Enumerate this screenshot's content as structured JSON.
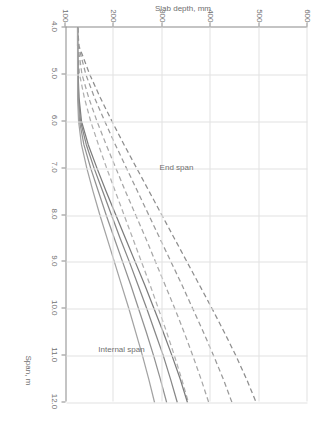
{
  "chart_data": {
    "type": "line",
    "title": "",
    "xlabel": "Span, m",
    "ylabel": "Slab depth, mm",
    "xlim": [
      4.0,
      12.0
    ],
    "ylim": [
      100,
      600
    ],
    "xticks": [
      "4.0",
      "5.0",
      "6.0",
      "7.0",
      "8.0",
      "9.0",
      "10.0",
      "11.0",
      "12.0"
    ],
    "yticks": [
      "100",
      "200",
      "300",
      "400",
      "500",
      "600"
    ],
    "grid": true,
    "legend_position": "none",
    "annotations": [
      {
        "text": "End span",
        "x": 7.0,
        "y": 330
      },
      {
        "text": "Internal span",
        "x": 10.9,
        "y": 215
      }
    ],
    "series": [
      {
        "name": "End span 1",
        "style": "dashed",
        "color": "#8e8e8e",
        "group": "End span",
        "x": [
          4.0,
          4.4,
          5.0,
          5.5,
          6.0,
          6.5,
          7.0,
          7.5,
          8.0,
          8.5,
          9.0,
          9.5,
          10.0,
          10.5,
          11.0,
          11.5,
          12.0
        ],
        "y": [
          125,
          128,
          150,
          172,
          196,
          221,
          247,
          273,
          299,
          325,
          351,
          377,
          403,
          428,
          452,
          474,
          494
        ]
      },
      {
        "name": "End span 2",
        "style": "dashed",
        "color": "#9a9a9a",
        "group": "End span",
        "x": [
          4.0,
          4.4,
          5.0,
          5.5,
          6.0,
          6.5,
          7.0,
          7.5,
          8.0,
          8.5,
          9.0,
          9.5,
          10.0,
          10.5,
          11.0,
          11.5,
          12.0
        ],
        "y": [
          125,
          127,
          142,
          160,
          181,
          203,
          226,
          249,
          272,
          295,
          318,
          341,
          363,
          385,
          406,
          426,
          444
        ]
      },
      {
        "name": "End span 3",
        "style": "dashed",
        "color": "#a6a6a6",
        "group": "End span",
        "x": [
          4.0,
          4.4,
          5.0,
          5.5,
          6.0,
          6.5,
          7.0,
          7.5,
          8.0,
          8.5,
          9.0,
          9.5,
          10.0,
          10.5,
          11.0,
          11.5,
          12.0
        ],
        "y": [
          125,
          126,
          134,
          148,
          165,
          184,
          204,
          224,
          245,
          266,
          286,
          306,
          326,
          345,
          363,
          380,
          396
        ]
      },
      {
        "name": "End span 4",
        "style": "dashed",
        "color": "#b0b0b0",
        "group": "End span",
        "x": [
          4.0,
          4.4,
          5.0,
          5.5,
          6.0,
          6.5,
          7.0,
          7.5,
          8.0,
          8.5,
          9.0,
          9.5,
          10.0,
          10.5,
          11.0,
          11.5,
          12.0
        ],
        "y": [
          125,
          125,
          129,
          139,
          152,
          168,
          185,
          203,
          221,
          239,
          257,
          275,
          292,
          309,
          325,
          340,
          354
        ]
      },
      {
        "name": "Internal span 1",
        "style": "solid",
        "color": "#7c7c7c",
        "group": "Internal span",
        "x": [
          4.0,
          4.4,
          5.0,
          5.5,
          6.0,
          6.5,
          7.0,
          7.5,
          8.0,
          8.5,
          9.0,
          9.5,
          10.0,
          10.5,
          11.0,
          11.5,
          12.0
        ],
        "y": [
          125,
          125,
          126,
          128,
          133,
          147,
          165,
          184,
          204,
          224,
          244,
          264,
          283,
          302,
          320,
          337,
          352
        ]
      },
      {
        "name": "Internal span 2",
        "style": "solid",
        "color": "#878787",
        "group": "Internal span",
        "x": [
          4.0,
          4.4,
          5.0,
          5.5,
          6.0,
          6.5,
          7.0,
          7.5,
          8.0,
          8.5,
          9.0,
          9.5,
          10.0,
          10.5,
          11.0,
          11.5,
          12.0
        ],
        "y": [
          125,
          125,
          126,
          127,
          131,
          143,
          159,
          177,
          195,
          213,
          232,
          250,
          268,
          285,
          302,
          317,
          331
        ]
      },
      {
        "name": "Internal span 3",
        "style": "solid",
        "color": "#929292",
        "group": "Internal span",
        "x": [
          4.0,
          4.4,
          5.0,
          5.5,
          6.0,
          6.5,
          7.0,
          7.5,
          8.0,
          8.5,
          9.0,
          9.5,
          10.0,
          10.5,
          11.0,
          11.5,
          12.0
        ],
        "y": [
          125,
          125,
          125,
          126,
          129,
          138,
          152,
          168,
          184,
          201,
          218,
          235,
          251,
          267,
          282,
          296,
          309
        ]
      },
      {
        "name": "Internal span 4",
        "style": "solid",
        "color": "#a3a3a3",
        "group": "Internal span",
        "x": [
          4.0,
          4.4,
          5.0,
          5.5,
          6.0,
          6.5,
          7.0,
          7.5,
          8.0,
          8.5,
          9.0,
          9.5,
          10.0,
          10.5,
          11.0,
          11.5,
          12.0
        ],
        "y": [
          125,
          125,
          125,
          125,
          127,
          133,
          144,
          157,
          171,
          186,
          201,
          216,
          231,
          245,
          259,
          272,
          284
        ]
      }
    ]
  },
  "colors": {
    "axis": "#8a8a8a",
    "grid": "#e2e2e2",
    "text": "#6f6f6f",
    "background": "#ffffff"
  }
}
